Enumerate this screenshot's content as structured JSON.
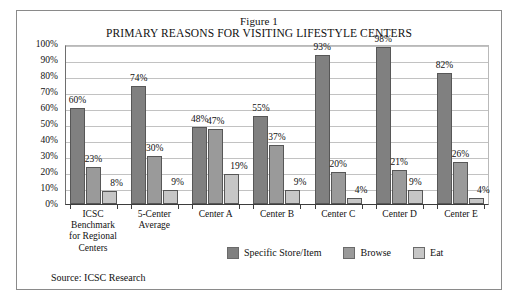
{
  "figure": {
    "title_line_1": "Figure 1",
    "title_line_2": "PRIMARY REASONS FOR VISITING LIFESTYLE CENTERS",
    "source": "Source: ICSC Research"
  },
  "colors": {
    "series_specific_store": "#808080",
    "series_browse": "#9a9a9a",
    "series_eat": "#c6c6c6",
    "gridline": "#c2c2c2",
    "axis": "#3d3d3d",
    "frame_border": "#8a8a8a",
    "text": "#111111"
  },
  "chart_data": {
    "type": "bar",
    "title": "PRIMARY REASONS FOR VISITING LIFESTYLE CENTERS",
    "subtitle": "Figure 1",
    "xlabel": "",
    "ylabel": "",
    "ylim": [
      0,
      100
    ],
    "ytick_labels": [
      "100%",
      "90%",
      "80%",
      "70%",
      "60%",
      "50%",
      "40%",
      "30%",
      "20%",
      "10%",
      "0%"
    ],
    "ytick_values": [
      100,
      90,
      80,
      70,
      60,
      50,
      40,
      30,
      20,
      10,
      0
    ],
    "grid": true,
    "legend_position": "bottom-center-right",
    "categories": [
      "ICSC Benchmark for Regional Centers",
      "5-Center Average",
      "Center A",
      "Center B",
      "Center C",
      "Center D",
      "Center E"
    ],
    "category_label_lines": [
      [
        "ICSC",
        "Benchmark",
        "for Regional",
        "Centers"
      ],
      [
        "5-Center",
        "Average"
      ],
      [
        "Center A"
      ],
      [
        "Center B"
      ],
      [
        "Center C"
      ],
      [
        "Center D"
      ],
      [
        "Center E"
      ]
    ],
    "series": [
      {
        "name": "Specific Store/Item",
        "color": "#808080",
        "values": [
          60,
          74,
          48,
          55,
          93,
          98,
          82
        ],
        "labels": [
          "60%",
          "74%",
          "48%",
          "55%",
          "93%",
          "98%",
          "82%"
        ]
      },
      {
        "name": "Browse",
        "color": "#9a9a9a",
        "values": [
          23,
          30,
          47,
          37,
          20,
          21,
          26
        ],
        "labels": [
          "23%",
          "30%",
          "47%",
          "37%",
          "20%",
          "21%",
          "26%"
        ]
      },
      {
        "name": "Eat",
        "color": "#c6c6c6",
        "values": [
          8,
          9,
          19,
          9,
          4,
          9,
          4
        ],
        "labels": [
          "8%",
          "9%",
          "19%",
          "9%",
          "4%",
          "9%",
          "4%"
        ]
      }
    ]
  },
  "legend": {
    "items": [
      {
        "label": "Specific Store/Item"
      },
      {
        "label": "Browse"
      },
      {
        "label": "Eat"
      }
    ]
  }
}
